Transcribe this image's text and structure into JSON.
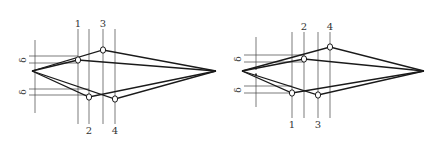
{
  "colors": {
    "line": "#1a1a1a",
    "guide": "#444444",
    "text": "#333333",
    "background": "#ffffff"
  },
  "symbols": {
    "delta": "δ"
  },
  "left_diagram": {
    "top_labels": [
      "1",
      "3"
    ],
    "bottom_labels": [
      "2",
      "4"
    ],
    "delta_labels": [
      "δ",
      "δ"
    ]
  },
  "right_diagram": {
    "top_labels": [
      "2",
      "4"
    ],
    "bottom_labels": [
      "1",
      "3"
    ],
    "delta_labels": [
      "δ",
      "δ"
    ]
  }
}
